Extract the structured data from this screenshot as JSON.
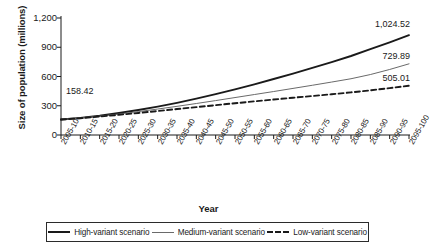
{
  "chart_data": {
    "type": "line",
    "title": "",
    "xlabel": "Year",
    "ylabel": "Size of population (millions)",
    "ylim": [
      0,
      1200
    ],
    "yticks": [
      "0",
      "300",
      "600",
      "900",
      "1,200"
    ],
    "ytick_values": [
      0,
      300,
      600,
      900,
      1200
    ],
    "grid": false,
    "legend_position": "bottom",
    "categories": [
      "2005-10",
      "2010-15",
      "2015-20",
      "2020-25",
      "2025-30",
      "2030-35",
      "2035-40",
      "2040-45",
      "2045-50",
      "2050-55",
      "2055-60",
      "2060-65",
      "2065-70",
      "2070-75",
      "2075-80",
      "2080-85",
      "2085-90",
      "2090-95",
      "2095-100"
    ],
    "series": [
      {
        "name": "High-variant scenario",
        "style": "solid-thick",
        "color": "#1a1a1a",
        "values": [
          158.42,
          176.0,
          198.0,
          225.0,
          256.0,
          291.0,
          330.0,
          373.0,
          419.0,
          468.0,
          520.0,
          574.0,
          630.0,
          688.0,
          748.0,
          810.0,
          880.0,
          950.0,
          1024.52
        ],
        "start_label": "158.42",
        "end_label": "1,024.52"
      },
      {
        "name": "Medium-variant scenario",
        "style": "solid-thin",
        "color": "#6a6a6a",
        "values": [
          158.42,
          174.0,
          193.0,
          215.0,
          240.0,
          266.0,
          294.0,
          323.0,
          353.0,
          384.0,
          415.0,
          446.0,
          478.0,
          510.0,
          543.0,
          577.0,
          620.0,
          672.0,
          729.89
        ],
        "end_label": "729.89"
      },
      {
        "name": "Low-variant scenario",
        "style": "dashed",
        "color": "#1a1a1a",
        "values": [
          158.42,
          172.0,
          189.0,
          207.0,
          226.0,
          246.0,
          266.0,
          286.0,
          306.0,
          326.0,
          345.0,
          364.0,
          382.0,
          400.0,
          418.0,
          437.0,
          458.0,
          481.0,
          505.01
        ],
        "end_label": "505.01"
      }
    ]
  },
  "annotations": {
    "start_value": "158.42",
    "high_end": "1,024.52",
    "medium_end": "729.89",
    "low_end": "505.01"
  },
  "legend": {
    "items": [
      {
        "label": "High-variant scenario",
        "style": "solid-thick"
      },
      {
        "label": "Medium-variant scenario",
        "style": "solid-thin"
      },
      {
        "label": "Low-variant scenario",
        "style": "dashed"
      }
    ]
  }
}
